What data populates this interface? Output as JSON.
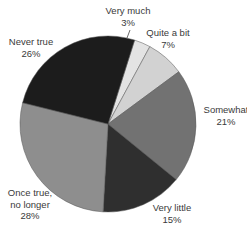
{
  "chart_data": {
    "type": "pie",
    "title": "",
    "start_angle_deg": 17.6,
    "direction": "clockwise",
    "categories": [
      "Very much",
      "Quite a bit",
      "Somewhat",
      "Very little",
      "Once true, no longer",
      "Never true"
    ],
    "values": [
      3,
      7,
      21,
      15,
      28,
      26
    ],
    "unit": "%",
    "slices": [
      {
        "label": "Very much",
        "value": 3,
        "value_label": "3%",
        "color": "#e3e3e3"
      },
      {
        "label": "Quite a bit",
        "value": 7,
        "value_label": "7%",
        "color": "#d2d2d2"
      },
      {
        "label": "Somewhat",
        "value": 21,
        "value_label": "21%",
        "color": "#727272"
      },
      {
        "label": "Very little",
        "value": 15,
        "value_label": "15%",
        "color": "#2f2f2f"
      },
      {
        "label": "Once true, no longer",
        "value": 28,
        "value_label": "28%",
        "color": "#8e8e8e"
      },
      {
        "label": "Never true",
        "value": 26,
        "value_label": "26%",
        "color": "#1c1c1c"
      }
    ],
    "labels": [
      {
        "lines": [
          "Very much",
          "3%"
        ],
        "x": 128,
        "y": 14,
        "leader": [
          130,
          30,
          127,
          38
        ]
      },
      {
        "lines": [
          "Quite a bit",
          "7%"
        ],
        "x": 168,
        "y": 36
      },
      {
        "lines": [
          "Somewhat",
          "21%"
        ],
        "x": 226,
        "y": 113
      },
      {
        "lines": [
          "Very little",
          "15%"
        ],
        "x": 172,
        "y": 211
      },
      {
        "lines": [
          "Once true,",
          "no longer",
          "28%"
        ],
        "x": 30,
        "y": 196
      },
      {
        "lines": [
          "Never true",
          "26%"
        ],
        "x": 31,
        "y": 45
      }
    ],
    "legend": "none",
    "grid": false
  }
}
